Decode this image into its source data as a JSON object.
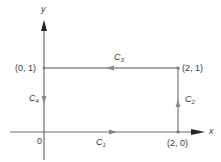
{
  "diagram": {
    "type": "closed rectangular contour in xy-plane",
    "axes": {
      "x_label": "x",
      "y_label": "y",
      "origin_label": "0"
    },
    "points": [
      {
        "id": "p00",
        "label": "0",
        "x": 0,
        "y": 0
      },
      {
        "id": "p20",
        "label": "(2, 0)",
        "x": 2,
        "y": 0
      },
      {
        "id": "p21",
        "label": "(2, 1)",
        "x": 2,
        "y": 1
      },
      {
        "id": "p01",
        "label": "(0, 1)",
        "x": 0,
        "y": 1
      }
    ],
    "curves": [
      {
        "name": "C",
        "sub": "1",
        "from": "(0, 0)",
        "to": "(2, 0)",
        "direction": "right"
      },
      {
        "name": "C",
        "sub": "2",
        "from": "(2, 0)",
        "to": "(2, 1)",
        "direction": "up"
      },
      {
        "name": "C",
        "sub": "3",
        "from": "(2, 1)",
        "to": "(0, 1)",
        "direction": "left"
      },
      {
        "name": "C",
        "sub": "4",
        "from": "(0, 1)",
        "to": "(0, 0)",
        "direction": "down"
      }
    ],
    "colors": {
      "path": "#8c8c8c",
      "axis": "#6e6e6e",
      "arrowhead": "#222222",
      "text": "#3a3a3a"
    }
  }
}
